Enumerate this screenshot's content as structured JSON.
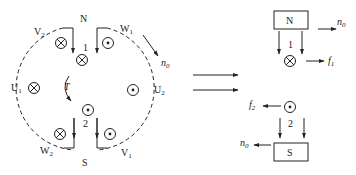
{
  "left_diagram": {
    "poles": {
      "north": "N",
      "south": "S"
    },
    "terminals": {
      "v2": {
        "main": "V",
        "sub": "2"
      },
      "w1": {
        "main": "W",
        "sub": "1"
      },
      "u1": {
        "main": "U",
        "sub": "1"
      },
      "u2": {
        "main": "U",
        "sub": "2"
      },
      "w2": {
        "main": "W",
        "sub": "2"
      },
      "v1": {
        "main": "V",
        "sub": "1"
      }
    },
    "conductor_labels": {
      "c1": "1",
      "c2": "2"
    },
    "torque_label": "T",
    "speed_label": {
      "main": "n",
      "sub": "0"
    }
  },
  "right_top": {
    "pole": "N",
    "conductor_label": "1",
    "force_label": {
      "main": "f",
      "sub": "1"
    },
    "speed_label": {
      "main": "n",
      "sub": "0"
    }
  },
  "right_bottom": {
    "pole": "S",
    "conductor_label": "2",
    "force_label": {
      "main": "f",
      "sub": "2"
    },
    "speed_label": {
      "main": "n",
      "sub": "0"
    }
  },
  "colors": {
    "stroke": "#222222",
    "background": "#ffffff"
  }
}
